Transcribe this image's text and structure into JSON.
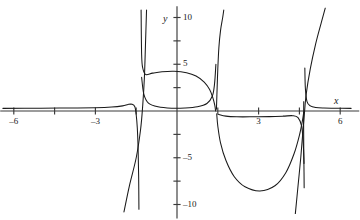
{
  "figure": {
    "name": "rational-function-graph",
    "background": "#ffffff",
    "curve_color": "#1a1a1a",
    "axis_color": "#3a3a3a"
  },
  "axes": {
    "x_label": "x",
    "y_label": "y",
    "x_label_pos": {
      "x": 334,
      "y": 96
    },
    "y_label_pos": {
      "x": 163,
      "y": 14
    },
    "origin_px": {
      "x": 177,
      "y": 111
    },
    "px_per_unit_x": 27.2,
    "px_per_unit_y": 9.35,
    "xlim": [
      -6.5,
      6.7
    ],
    "ylim": [
      -11.5,
      11.2
    ],
    "grid": false,
    "x_ticks": [
      {
        "value": -6,
        "label": "-6",
        "px": 14,
        "labeled": true
      },
      {
        "value": -4.5,
        "label": "",
        "px": 55,
        "labeled": false
      },
      {
        "value": -3,
        "label": "-3",
        "px": 96,
        "labeled": true
      },
      {
        "value": -1.5,
        "label": "",
        "px": 136,
        "labeled": false
      },
      {
        "value": 1.5,
        "label": "",
        "px": 218,
        "labeled": false
      },
      {
        "value": 3,
        "label": "3",
        "px": 258,
        "labeled": true
      },
      {
        "value": 4.5,
        "label": "",
        "px": 299,
        "labeled": false
      },
      {
        "value": 6,
        "label": "6",
        "px": 340,
        "labeled": true
      }
    ],
    "y_ticks": [
      {
        "value": 10,
        "label": "10",
        "px": 18,
        "labeled": true
      },
      {
        "value": 7.5,
        "label": "",
        "px": 41,
        "labeled": false
      },
      {
        "value": 5,
        "label": "5",
        "px": 64,
        "labeled": true
      },
      {
        "value": 2.5,
        "label": "",
        "px": 88,
        "labeled": false
      },
      {
        "value": -2.5,
        "label": "",
        "px": 135,
        "labeled": false
      },
      {
        "value": -5,
        "label": "-5",
        "px": 158,
        "labeled": true
      },
      {
        "value": -7.5,
        "label": "",
        "px": 182,
        "labeled": false
      },
      {
        "value": -10,
        "label": "-10",
        "px": 205,
        "labeled": true
      }
    ]
  },
  "chart_data": {
    "type": "line",
    "title": "",
    "xlabel": "x",
    "ylabel": "y",
    "xlim": [
      -6.5,
      6.7
    ],
    "ylim": [
      -11.5,
      11.2
    ],
    "grid": false,
    "legend": "none",
    "asymptotes": [
      {
        "type": "vertical",
        "x": -1.38
      },
      {
        "type": "vertical",
        "x": 1.45
      },
      {
        "type": "vertical",
        "x": 4.68
      }
    ],
    "features": [
      {
        "name": "upper-arch-peak",
        "x": 0.05,
        "y": 4.2
      },
      {
        "name": "lower-dip-minimum",
        "x": 3.05,
        "y": -8.55
      },
      {
        "name": "left-flat-branch-asymptote-y",
        "y": 0.0
      },
      {
        "name": "right-flat-branch-asymptote-y",
        "y": 0.0
      }
    ],
    "series": [
      {
        "name": "left-horizontal-branch",
        "comment": "comes in from x=-6 just above y=0, dives down at x=-1.38",
        "points": [
          [
            -6.4,
            0.28
          ],
          [
            -5.0,
            0.3
          ],
          [
            -4.0,
            0.32
          ],
          [
            -3.0,
            0.35
          ],
          [
            -2.4,
            0.42
          ],
          [
            -2.0,
            0.55
          ],
          [
            -1.8,
            0.7
          ],
          [
            -1.65,
            0.72
          ],
          [
            -1.55,
            0.45
          ],
          [
            -1.5,
            -0.4
          ],
          [
            -1.46,
            -1.8
          ],
          [
            -1.43,
            -4.0
          ],
          [
            -1.41,
            -7.0
          ],
          [
            -1.4,
            -10.5
          ]
        ]
      },
      {
        "name": "left-steep-descending-line",
        "comment": "steep straight-ish branch crossing axis near x=-1.28 going to lower-left",
        "points": [
          [
            -1.12,
            10.8
          ],
          [
            -1.16,
            7.0
          ],
          [
            -1.2,
            3.5
          ],
          [
            -1.26,
            0.6
          ],
          [
            -1.34,
            -2.0
          ],
          [
            -1.5,
            -5.0
          ],
          [
            -1.75,
            -8.0
          ],
          [
            -1.95,
            -10.8
          ]
        ]
      },
      {
        "name": "upper-arch",
        "comment": "closed arch peaking near y=4.2, legs dropping toward y~0.35 then down through the asymptotes",
        "points": [
          [
            -1.32,
            10.8
          ],
          [
            -1.3,
            6.0
          ],
          [
            -1.26,
            4.6
          ],
          [
            -1.15,
            3.9
          ],
          [
            -0.9,
            4.05
          ],
          [
            -0.55,
            4.2
          ],
          [
            -0.1,
            4.25
          ],
          [
            0.35,
            4.1
          ],
          [
            0.7,
            3.75
          ],
          [
            1.0,
            3.1
          ],
          [
            1.2,
            2.3
          ],
          [
            1.32,
            1.4
          ],
          [
            1.39,
            0.6
          ],
          [
            1.42,
            0.0
          ]
        ]
      },
      {
        "name": "upper-arch-lower-lobe",
        "comment": "lower edge of the closed oval: shallow bowl just above y=0 between x=-1.3 and x=1.45",
        "points": [
          [
            -1.3,
            3.6
          ],
          [
            -1.22,
            1.8
          ],
          [
            -1.05,
            0.85
          ],
          [
            -0.7,
            0.45
          ],
          [
            -0.2,
            0.3
          ],
          [
            0.3,
            0.32
          ],
          [
            0.75,
            0.45
          ],
          [
            1.1,
            0.8
          ],
          [
            1.3,
            1.6
          ],
          [
            1.38,
            2.9
          ],
          [
            1.43,
            5.0
          ]
        ]
      },
      {
        "name": "right-rising-asymptotic-branch",
        "comment": "branch hugging x=1.45 rising to +10",
        "points": [
          [
            1.45,
            0.2
          ],
          [
            1.47,
            2.0
          ],
          [
            1.5,
            4.5
          ],
          [
            1.54,
            6.8
          ],
          [
            1.6,
            8.6
          ],
          [
            1.68,
            10.0
          ],
          [
            1.72,
            10.8
          ]
        ]
      },
      {
        "name": "lower-dip",
        "comment": "deep downward arc from the x=1.45 asymptote to near x=4.68, min ~ -8.55 at x=3.05",
        "points": [
          [
            1.46,
            -0.3
          ],
          [
            1.5,
            -1.6
          ],
          [
            1.6,
            -3.4
          ],
          [
            1.8,
            -5.3
          ],
          [
            2.1,
            -7.0
          ],
          [
            2.5,
            -8.1
          ],
          [
            3.05,
            -8.55
          ],
          [
            3.6,
            -8.0
          ],
          [
            4.0,
            -6.6
          ],
          [
            4.3,
            -4.6
          ],
          [
            4.5,
            -2.6
          ],
          [
            4.62,
            -0.9
          ],
          [
            4.66,
            -0.1
          ]
        ]
      },
      {
        "name": "right-horizontal-branch",
        "comment": "flat branch just below y=0 from x=1.6 to the asymptote at x=4.68",
        "points": [
          [
            1.52,
            -0.35
          ],
          [
            1.8,
            -0.55
          ],
          [
            2.2,
            -0.62
          ],
          [
            2.8,
            -0.62
          ],
          [
            3.4,
            -0.6
          ],
          [
            3.9,
            -0.55
          ],
          [
            4.25,
            -0.5
          ],
          [
            4.45,
            -0.7
          ],
          [
            4.58,
            -1.6
          ],
          [
            4.64,
            -3.4
          ],
          [
            4.67,
            -5.6
          ]
        ]
      },
      {
        "name": "right-far-flat-branch",
        "comment": "from the x=4.68 asymptote, small hook then flat just above y=0 out to x=6",
        "points": [
          [
            4.7,
            4.6
          ],
          [
            4.72,
            2.4
          ],
          [
            4.78,
            1.0
          ],
          [
            4.9,
            0.55
          ],
          [
            5.1,
            0.38
          ],
          [
            5.4,
            0.32
          ],
          [
            5.8,
            0.3
          ],
          [
            6.4,
            0.28
          ]
        ]
      },
      {
        "name": "far-right-steep-rising-line",
        "comment": "steep straight branch from lower-left of x=4.7 up through the right side to +11",
        "points": [
          [
            4.35,
            -11.0
          ],
          [
            4.45,
            -8.0
          ],
          [
            4.55,
            -5.0
          ],
          [
            4.62,
            -2.5
          ],
          [
            4.68,
            -0.4
          ],
          [
            4.75,
            1.8
          ],
          [
            4.9,
            4.5
          ],
          [
            5.1,
            7.2
          ],
          [
            5.3,
            9.4
          ],
          [
            5.45,
            11.0
          ]
        ]
      },
      {
        "name": "right-asymptote-hook-left",
        "comment": "short near-vertical tick of the branch at x=4.68 below axis",
        "points": [
          [
            4.66,
            1.0
          ],
          [
            4.655,
            -1.5
          ],
          [
            4.66,
            -4.0
          ],
          [
            4.67,
            -6.5
          ],
          [
            4.675,
            -8.2
          ]
        ]
      }
    ]
  }
}
